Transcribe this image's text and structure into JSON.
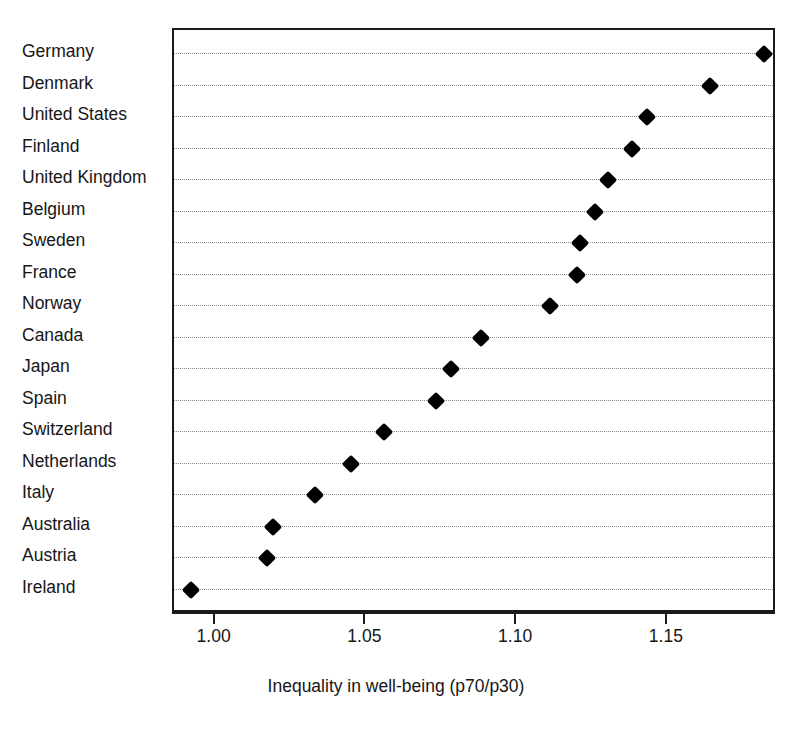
{
  "chart_data": {
    "type": "scatter",
    "subtype": "dot-plot",
    "title": "",
    "xlabel": "Inequality in well-being (p70/p30)",
    "ylabel": "",
    "xlim": [
      0.9862,
      1.1862
    ],
    "xticks": [
      1.0,
      1.05,
      1.1,
      1.15
    ],
    "xtick_labels": [
      "1.00",
      "1.05",
      "1.10",
      "1.15"
    ],
    "grid": "horizontal dotted gridlines, one per category",
    "legend": "none",
    "orientation": "horizontal",
    "marker": "filled black diamond",
    "sort": "descending by value (top to bottom)",
    "categories": [
      "Germany",
      "Denmark",
      "United States",
      "Finland",
      "United Kingdom",
      "Belgium",
      "Sweden",
      "France",
      "Norway",
      "Canada",
      "Japan",
      "Spain",
      "Switzerland",
      "Netherlands",
      "Italy",
      "Australia",
      "Austria",
      "Ireland"
    ],
    "values": [
      1.182,
      1.164,
      1.143,
      1.138,
      1.13,
      1.126,
      1.121,
      1.12,
      1.111,
      1.088,
      1.078,
      1.073,
      1.056,
      1.045,
      1.033,
      1.019,
      1.017,
      0.992
    ],
    "points": [
      {
        "category": "Germany",
        "value": 1.182
      },
      {
        "category": "Denmark",
        "value": 1.164
      },
      {
        "category": "United States",
        "value": 1.143
      },
      {
        "category": "Finland",
        "value": 1.138
      },
      {
        "category": "United Kingdom",
        "value": 1.13
      },
      {
        "category": "Belgium",
        "value": 1.126
      },
      {
        "category": "Sweden",
        "value": 1.121
      },
      {
        "category": "France",
        "value": 1.12
      },
      {
        "category": "Norway",
        "value": 1.111
      },
      {
        "category": "Canada",
        "value": 1.088
      },
      {
        "category": "Japan",
        "value": 1.078
      },
      {
        "category": "Spain",
        "value": 1.073
      },
      {
        "category": "Switzerland",
        "value": 1.056
      },
      {
        "category": "Netherlands",
        "value": 1.045
      },
      {
        "category": "Italy",
        "value": 1.033
      },
      {
        "category": "Australia",
        "value": 1.019
      },
      {
        "category": "Austria",
        "value": 1.017
      },
      {
        "category": "Ireland",
        "value": 0.992
      }
    ],
    "colors": {
      "marker": "#000000",
      "frame": "#1a1a1a",
      "gridline": "#8a8a8a",
      "background": "#ffffff",
      "text": "#161616"
    }
  }
}
